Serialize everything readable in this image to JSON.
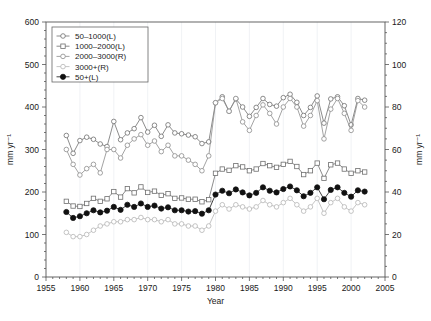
{
  "chart_data": {
    "type": "line",
    "title": "",
    "xlabel": "Year",
    "ylabel": "mm yr⁻¹",
    "ylabel_right": "mm yr⁻¹",
    "xlim": [
      1955,
      2005
    ],
    "ylim": [
      0,
      600
    ],
    "ylim_right": [
      0,
      120
    ],
    "xticks": [
      1955,
      1960,
      1965,
      1970,
      1975,
      1980,
      1985,
      1990,
      1995,
      2000,
      2005
    ],
    "yticks_left": [
      0,
      100,
      200,
      300,
      400,
      500,
      600
    ],
    "yticks_right": [
      0,
      20,
      40,
      60,
      80,
      100,
      120
    ],
    "grid": "vertical-faint",
    "legend_position": "upper-left",
    "x": [
      1958,
      1959,
      1960,
      1961,
      1962,
      1963,
      1964,
      1965,
      1966,
      1967,
      1968,
      1969,
      1970,
      1971,
      1972,
      1973,
      1974,
      1975,
      1976,
      1977,
      1978,
      1979,
      1980,
      1981,
      1982,
      1983,
      1984,
      1985,
      1986,
      1987,
      1988,
      1989,
      1990,
      1991,
      1992,
      1993,
      1994,
      1995,
      1996,
      1997,
      1998,
      1999,
      2000,
      2001,
      2002
    ],
    "series": [
      {
        "name": "50–1000(L)",
        "axis": "left",
        "marker": "open-circle",
        "color": "#6e6e6e",
        "values": [
          333,
          291,
          321,
          329,
          324,
          313,
          307,
          366,
          323,
          339,
          349,
          375,
          341,
          357,
          331,
          358,
          339,
          337,
          334,
          330,
          314,
          318,
          410,
          424,
          390,
          419,
          400,
          378,
          399,
          420,
          406,
          402,
          422,
          430,
          411,
          380,
          399,
          426,
          362,
          419,
          424,
          403,
          358,
          420,
          416
        ]
      },
      {
        "name": "1000–2000(L)",
        "axis": "left",
        "marker": "open-square",
        "color": "#6e6e6e",
        "values": [
          178,
          167,
          166,
          173,
          185,
          178,
          184,
          201,
          188,
          208,
          198,
          212,
          199,
          202,
          192,
          196,
          185,
          186,
          183,
          183,
          177,
          182,
          244,
          254,
          251,
          262,
          259,
          250,
          254,
          267,
          262,
          258,
          265,
          272,
          260,
          241,
          250,
          268,
          232,
          264,
          268,
          254,
          244,
          250,
          247
        ]
      },
      {
        "name": "2000–3000(R)",
        "axis": "right",
        "marker": "open-circle",
        "color": "#8c8c8c",
        "values": [
          60,
          53,
          48,
          51,
          53,
          49,
          60,
          60,
          56,
          62,
          65,
          67,
          62,
          64,
          59,
          62,
          57,
          57,
          55,
          53,
          50,
          57,
          82,
          84,
          78,
          84,
          73,
          69,
          76,
          81,
          77,
          72,
          80,
          84,
          80,
          71,
          76,
          83,
          65,
          79,
          84,
          77,
          69,
          83,
          80
        ]
      },
      {
        "name": "3000+(R)",
        "axis": "right",
        "marker": "open-circle",
        "color": "#b5b5b5",
        "values": [
          21,
          19,
          19,
          20,
          22,
          24,
          25,
          26,
          26,
          27,
          27,
          28,
          27,
          27,
          26,
          27,
          25,
          25,
          24,
          24,
          22,
          24,
          31,
          34,
          32,
          34,
          33,
          32,
          33,
          36,
          34,
          33,
          35,
          37,
          34,
          31,
          33,
          37,
          30,
          35,
          37,
          33,
          31,
          35,
          34
        ]
      },
      {
        "name": "50+(L)",
        "axis": "left",
        "marker": "filled-circle",
        "color": "#111111",
        "values": [
          153,
          139,
          143,
          150,
          157,
          152,
          156,
          165,
          158,
          170,
          165,
          173,
          165,
          168,
          161,
          164,
          157,
          157,
          154,
          155,
          149,
          157,
          194,
          203,
          197,
          206,
          199,
          192,
          198,
          211,
          203,
          199,
          207,
          213,
          204,
          190,
          198,
          211,
          183,
          205,
          211,
          198,
          189,
          204,
          201
        ]
      }
    ]
  },
  "legend": {
    "entries": [
      {
        "label": "50–1000(L)",
        "marker": "open-circle"
      },
      {
        "label": "1000–2000(L)",
        "marker": "open-square"
      },
      {
        "label": "2000–3000(R)",
        "marker": "open-circle"
      },
      {
        "label": "3000+(R)",
        "marker": "open-circle"
      },
      {
        "label": "50+(L)",
        "marker": "filled-circle"
      }
    ]
  },
  "axes": {
    "x_title": "Year",
    "y_left_title": "mm yr⁻¹",
    "y_right_title": "mm yr⁻¹"
  }
}
